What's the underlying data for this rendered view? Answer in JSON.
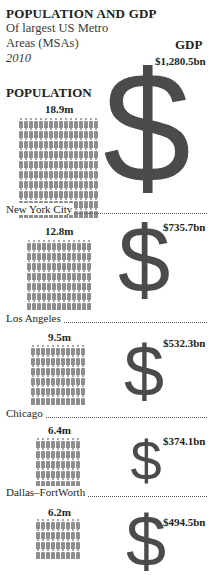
{
  "header": {
    "title": "POPULATION AND GDP",
    "subtitle": "Of largest US Metro Areas (MSAs)",
    "year": "2010",
    "gdp_label": "GDP",
    "population_label": "POPULATION"
  },
  "rows": [
    {
      "city": "New York City",
      "population": "18.9m",
      "gdp": "$1,280.5bn",
      "symbol": "$"
    },
    {
      "city": "Los Angeles",
      "population": "12.8m",
      "gdp": "$735.7bn",
      "symbol": "$"
    },
    {
      "city": "Chicago",
      "population": "9.5m",
      "gdp": "$532.3bn",
      "symbol": "$"
    },
    {
      "city": "Dallas–FortWorth",
      "population": "6.4m",
      "gdp": "$374.1bn",
      "symbol": "$"
    },
    {
      "city": "",
      "population": "6.2m",
      "gdp": "$494.5bn",
      "symbol": "$"
    }
  ],
  "chart_data": {
    "type": "table",
    "title": "POPULATION AND GDP",
    "subtitle": "Of largest US Metro Areas (MSAs), 2010",
    "columns": [
      "Metro Area",
      "Population (m)",
      "GDP ($bn)"
    ],
    "categories": [
      "New York City",
      "Los Angeles",
      "Chicago",
      "Dallas–FortWorth",
      "(unlabeled, cut off)"
    ],
    "series": [
      {
        "name": "Population (millions)",
        "values": [
          18.9,
          12.8,
          9.5,
          6.4,
          6.2
        ]
      },
      {
        "name": "GDP ($bn)",
        "values": [
          1280.5,
          735.7,
          532.3,
          374.1,
          494.5
        ]
      }
    ],
    "encoding": "Population shown as grid of person icons; GDP shown as scaled dollar-sign glyph",
    "colors": {
      "icons": "#8e8e8e",
      "dollar": "#4b4b4b",
      "text": "#231f20"
    }
  }
}
